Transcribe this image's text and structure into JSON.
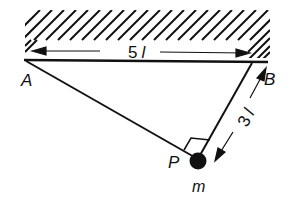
{
  "diagram": {
    "type": "physics-mechanics",
    "points": {
      "A": {
        "label": "A"
      },
      "B": {
        "label": "B"
      },
      "P": {
        "label": "P"
      }
    },
    "mass_label": "m",
    "dimensions": {
      "AB": {
        "label": "5 l",
        "text_value": "5",
        "text_unit": "l"
      },
      "BP": {
        "label": "3 l",
        "text_value": "3",
        "text_unit": "l"
      }
    },
    "right_angle_at": "P",
    "colors": {
      "ink": "#111111",
      "background": "#ffffff"
    }
  }
}
